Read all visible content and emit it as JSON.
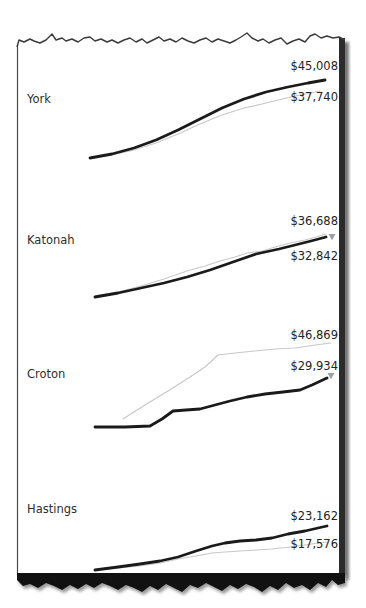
{
  "style": {
    "primary_line_color": "#1a1a1a",
    "reference_line_color": "#c8c8c8",
    "marker_color": "#9aa0a6",
    "text_color": "#2e2e2e",
    "paper_edge_color": "#3a3a3a",
    "torn_band_color": "#111111",
    "right_shadow_color": "#2b2b2b"
  },
  "rows": [
    {
      "name": "York"
    },
    {
      "name": "Katonah"
    },
    {
      "name": "Croton"
    },
    {
      "name": "Hastings"
    }
  ],
  "chart_data": [
    {
      "type": "line",
      "title": "York",
      "legend_position": "none",
      "grid": false,
      "series": [
        {
          "name": "primary",
          "end_value": 45008,
          "end_label": "$45,008",
          "points_px": [
            [
              90,
              158
            ],
            [
              112,
              154
            ],
            [
              134,
              148
            ],
            [
              156,
              140
            ],
            [
              178,
              130
            ],
            [
              200,
              119
            ],
            [
              222,
              108
            ],
            [
              244,
              99
            ],
            [
              266,
              92
            ],
            [
              288,
              87
            ],
            [
              308,
              83
            ],
            [
              325,
              80
            ]
          ]
        },
        {
          "name": "reference",
          "end_value": 37740,
          "end_label": "$37,740",
          "points_px": [
            [
              90,
              158
            ],
            [
              112,
              155
            ],
            [
              134,
              150
            ],
            [
              156,
              143
            ],
            [
              178,
              134
            ],
            [
              200,
              124
            ],
            [
              222,
              115
            ],
            [
              244,
              108
            ],
            [
              262,
              104
            ],
            [
              278,
              100
            ],
            [
              295,
              96
            ],
            [
              310,
              93
            ],
            [
              320,
              91
            ]
          ]
        }
      ],
      "marker": null
    },
    {
      "type": "line",
      "title": "Katonah",
      "legend_position": "none",
      "grid": false,
      "series": [
        {
          "name": "primary",
          "end_value": 32842,
          "end_label": "$32,842",
          "points_px": [
            [
              95,
              297
            ],
            [
              118,
              293
            ],
            [
              141,
              288
            ],
            [
              164,
              283
            ],
            [
              187,
              277
            ],
            [
              210,
              270
            ],
            [
              233,
              262
            ],
            [
              256,
              254
            ],
            [
              279,
              249
            ],
            [
              295,
              245
            ],
            [
              311,
              241
            ],
            [
              326,
              237
            ]
          ]
        },
        {
          "name": "reference",
          "end_value": 36688,
          "end_label": "$36,688",
          "points_px": [
            [
              95,
              296
            ],
            [
              118,
              292
            ],
            [
              141,
              286
            ],
            [
              164,
              279
            ],
            [
              187,
              271
            ],
            [
              205,
              266
            ],
            [
              220,
              261
            ],
            [
              235,
              257
            ],
            [
              247,
              253
            ],
            [
              262,
              251
            ],
            [
              275,
              247
            ],
            [
              290,
              243
            ],
            [
              305,
              240
            ],
            [
              316,
              237
            ],
            [
              326,
              234
            ]
          ]
        }
      ],
      "marker": {
        "shape": "triangle-down",
        "x": 332,
        "y": 237
      }
    },
    {
      "type": "line",
      "title": "Croton",
      "legend_position": "none",
      "grid": false,
      "series": [
        {
          "name": "primary",
          "end_value": 29934,
          "end_label": "$29,934",
          "points_px": [
            [
              95,
              427
            ],
            [
              125,
              427
            ],
            [
              150,
              426
            ],
            [
              162,
              419
            ],
            [
              173,
              411
            ],
            [
              186,
              410
            ],
            [
              200,
              409
            ],
            [
              215,
              405
            ],
            [
              230,
              401
            ],
            [
              247,
              397
            ],
            [
              265,
              394
            ],
            [
              283,
              392
            ],
            [
              300,
              390
            ],
            [
              312,
              385
            ],
            [
              327,
              378
            ]
          ]
        },
        {
          "name": "reference",
          "end_value": 46869,
          "end_label": "$46,869",
          "points_px": [
            [
              123,
              419
            ],
            [
              145,
              405
            ],
            [
              168,
              391
            ],
            [
              190,
              377
            ],
            [
              205,
              367
            ],
            [
              218,
              355
            ],
            [
              235,
              353
            ],
            [
              255,
              351
            ],
            [
              275,
              349
            ],
            [
              295,
              348
            ],
            [
              315,
              345
            ],
            [
              331,
              343
            ]
          ]
        }
      ],
      "marker": {
        "shape": "triangle-down",
        "x": 331,
        "y": 376
      }
    },
    {
      "type": "line",
      "title": "Hastings",
      "legend_position": "none",
      "grid": false,
      "series": [
        {
          "name": "primary",
          "end_value": 23162,
          "end_label": "$23,162",
          "points_px": [
            [
              95,
              570
            ],
            [
              118,
              567
            ],
            [
              140,
              564
            ],
            [
              160,
              561
            ],
            [
              178,
              557
            ],
            [
              196,
              551
            ],
            [
              212,
              546
            ],
            [
              225,
              543
            ],
            [
              240,
              541
            ],
            [
              256,
              540
            ],
            [
              272,
              538
            ],
            [
              288,
              534
            ],
            [
              305,
              531
            ],
            [
              318,
              528
            ],
            [
              327,
              526
            ]
          ]
        },
        {
          "name": "reference",
          "end_value": 17576,
          "end_label": "$17,576",
          "points_px": [
            [
              95,
              570
            ],
            [
              118,
              568
            ],
            [
              140,
              566
            ],
            [
              160,
              563
            ],
            [
              178,
              559
            ],
            [
              196,
              556
            ],
            [
              212,
              553
            ],
            [
              225,
              552
            ],
            [
              240,
              551
            ],
            [
              256,
              550
            ],
            [
              272,
              549
            ],
            [
              290,
              547
            ],
            [
              305,
              545
            ],
            [
              318,
              543
            ],
            [
              327,
              542
            ]
          ]
        }
      ],
      "marker": null
    }
  ]
}
